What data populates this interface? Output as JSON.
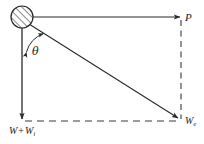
{
  "figure": {
    "kind": "force-vector-diagram",
    "background_color": "#ffffff",
    "stroke_color": "#2a2a2a",
    "labels": {
      "applied_force": "P",
      "effective_weight_symbol": "W",
      "effective_weight_subscript": "e",
      "total_weight_symbol": "W",
      "total_weight_operator": "+",
      "total_weight_second_symbol": "W",
      "total_weight_second_subscript": "i",
      "angle": "θ"
    },
    "nodes": {
      "origin_label": "hatched-circle-body",
      "circle_center_x": 22,
      "circle_center_y": 17,
      "circle_radius": 11
    },
    "vectors": [
      {
        "name": "horizontal-force",
        "label": "P",
        "from_x": 33,
        "from_y": 17,
        "to_x": 181,
        "to_y": 17,
        "style": "solid",
        "arrowhead": "end"
      },
      {
        "name": "vertical-weight",
        "label": "W + Wi",
        "from_x": 22,
        "from_y": 28,
        "to_x": 22,
        "to_y": 120,
        "style": "solid",
        "arrowhead": "end"
      },
      {
        "name": "resultant-diagonal",
        "label": "We",
        "from_x": 29,
        "from_y": 25,
        "to_x": 179,
        "to_y": 119,
        "style": "solid",
        "arrowhead": "end"
      },
      {
        "name": "right-side-dashed",
        "from_x": 181,
        "from_y": 19,
        "to_x": 181,
        "to_y": 120,
        "style": "dashed",
        "arrowhead": "none"
      },
      {
        "name": "bottom-dashed",
        "from_x": 24,
        "from_y": 121,
        "to_x": 180,
        "to_y": 121,
        "style": "dashed",
        "arrowhead": "none"
      }
    ],
    "angle_arc": {
      "name": "theta-angle-arc",
      "label": "θ",
      "between": [
        "vertical-weight",
        "resultant-diagonal"
      ],
      "double_headed": true
    }
  }
}
